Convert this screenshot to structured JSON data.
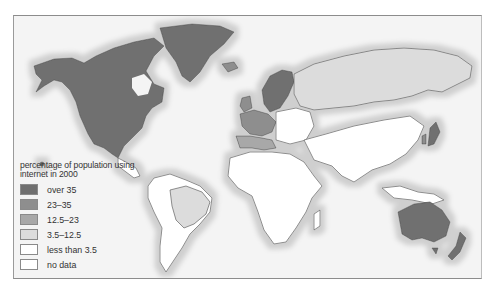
{
  "map": {
    "subject": "world map of internet usage by country",
    "colors": {
      "over_35": "#6f6f6f",
      "23_35": "#8e8e8e",
      "12_5_23": "#a8a8a8",
      "3_5_12_5": "#dcdcdc",
      "less_than_3_5": "#ffffff",
      "no_data": "#ffffff",
      "ocean": "#f4f4f4",
      "coast_halo": "#d2d2d2",
      "border": "#444444"
    },
    "regions": [
      {
        "name": "North America (USA, Canada)",
        "category": "over 35"
      },
      {
        "name": "Greenland",
        "category": "over 35"
      },
      {
        "name": "Scandinavia",
        "category": "over 35"
      },
      {
        "name": "Western Europe",
        "category": "23–35"
      },
      {
        "name": "Southern Europe",
        "category": "12.5–23"
      },
      {
        "name": "Russia",
        "category": "3.5–12.5"
      },
      {
        "name": "Brazil",
        "category": "3.5–12.5"
      },
      {
        "name": "Africa",
        "category": "less than 3.5"
      },
      {
        "name": "China / South Asia",
        "category": "less than 3.5"
      },
      {
        "name": "Japan",
        "category": "over 35"
      },
      {
        "name": "Australia",
        "category": "over 35"
      },
      {
        "name": "New Zealand",
        "category": "over 35"
      }
    ]
  },
  "legend": {
    "title": "percentage of population using internet in 2000",
    "items": [
      {
        "label": "over 35",
        "color": "#6f6f6f"
      },
      {
        "label": "23–35",
        "color": "#8e8e8e"
      },
      {
        "label": "12.5–23",
        "color": "#a8a8a8"
      },
      {
        "label": "3.5–12.5",
        "color": "#dcdcdc"
      },
      {
        "label": "less than 3.5",
        "color": "#ffffff"
      },
      {
        "label": "no data",
        "color": "#ffffff"
      }
    ]
  }
}
